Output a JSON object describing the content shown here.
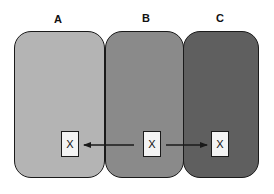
{
  "diagram": {
    "panels": [
      {
        "label": "A",
        "color": "#b4b4b4"
      },
      {
        "label": "B",
        "color": "#8a8a8a"
      },
      {
        "label": "C",
        "color": "#5f5f5f"
      }
    ],
    "boxes": [
      {
        "panel": "A",
        "text": "X"
      },
      {
        "panel": "B",
        "text": "X"
      },
      {
        "panel": "C",
        "text": "X"
      }
    ],
    "arrows": [
      {
        "from": "B",
        "to": "A",
        "direction": "left"
      },
      {
        "from": "B",
        "to": "C",
        "direction": "right"
      }
    ],
    "stroke_color": "#1a1a1a"
  }
}
